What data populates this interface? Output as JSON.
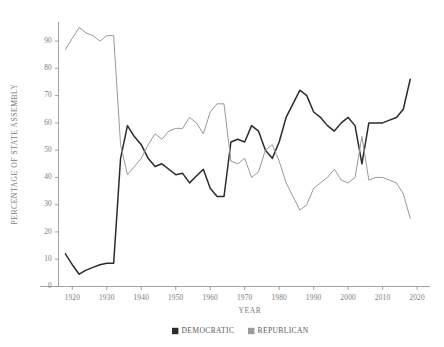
{
  "chart_data": {
    "type": "line",
    "title": "",
    "xlabel": "YEAR",
    "ylabel": "PERCENTAGE OF STATE ASSEMBLY",
    "xlim": [
      1916,
      2022
    ],
    "ylim": [
      0,
      97
    ],
    "grid": false,
    "legend_position": "bottom-center",
    "x_ticks": [
      1920,
      1930,
      1940,
      1950,
      1960,
      1970,
      1980,
      1990,
      2000,
      2010,
      2020
    ],
    "y_ticks": [
      0,
      10,
      20,
      30,
      40,
      50,
      60,
      70,
      80,
      90
    ],
    "x": [
      1918,
      1920,
      1922,
      1924,
      1926,
      1928,
      1930,
      1932,
      1934,
      1936,
      1938,
      1940,
      1942,
      1944,
      1946,
      1948,
      1950,
      1952,
      1954,
      1956,
      1958,
      1960,
      1962,
      1964,
      1966,
      1968,
      1970,
      1972,
      1974,
      1976,
      1978,
      1980,
      1982,
      1984,
      1986,
      1988,
      1990,
      1992,
      1994,
      1996,
      1998,
      2000,
      2002,
      2004,
      2006,
      2008,
      2010,
      2012,
      2014,
      2016,
      2018
    ],
    "series": [
      {
        "name": "DEMOCRATIC",
        "color": "#2b2b2b",
        "width": 1.5,
        "values": [
          12,
          8,
          4.5,
          6,
          7,
          8,
          8.5,
          8.5,
          47,
          59,
          55,
          52,
          47,
          44,
          45,
          43,
          41,
          41.5,
          38,
          40.5,
          43,
          36,
          33,
          33,
          53,
          54,
          53,
          59,
          57,
          50,
          47,
          53,
          62,
          67,
          72,
          70,
          64,
          62,
          59,
          57,
          60,
          62,
          59,
          45,
          60,
          60,
          60,
          61,
          62,
          65,
          76
        ]
      },
      {
        "name": "REPUBLICAN",
        "color": "#9a9a9a",
        "width": 1.0,
        "values": [
          87,
          91,
          95,
          93,
          92,
          90,
          92,
          92,
          52,
          41,
          44,
          47,
          52,
          56,
          54,
          57,
          58,
          58,
          62,
          60,
          56,
          64,
          67,
          67,
          46,
          45,
          47,
          40,
          42,
          50,
          52,
          46,
          38,
          33,
          28,
          30,
          36,
          38,
          40,
          43,
          39,
          38,
          40,
          55,
          39,
          40,
          40,
          39,
          38,
          34,
          25
        ]
      }
    ],
    "legend": [
      {
        "label": "DEMOCRATIC",
        "swatch_color": "#2b2b2b",
        "marker": "square"
      },
      {
        "label": "REPUBLICAN",
        "swatch_color": "#9a9a9a",
        "marker": "square"
      }
    ]
  }
}
